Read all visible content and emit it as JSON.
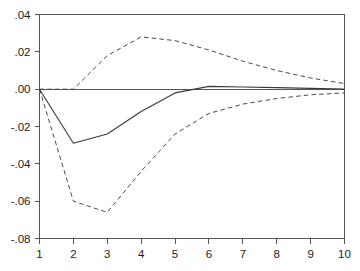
{
  "chart_data": {
    "type": "line",
    "title": "",
    "subtitle": "",
    "xlabel": "",
    "ylabel": "",
    "x": [
      1,
      2,
      3,
      4,
      5,
      6,
      7,
      8,
      9,
      10
    ],
    "xlim": [
      1,
      10
    ],
    "ylim": [
      -0.08,
      0.04
    ],
    "grid": false,
    "legend": "none",
    "x_ticks": [
      "1",
      "2",
      "3",
      "4",
      "5",
      "6",
      "7",
      "8",
      "9",
      "10"
    ],
    "y_ticks": [
      ".04",
      ".02",
      ".00",
      "-.02",
      "-.04",
      "-.06",
      "-.08"
    ],
    "y_tick_values": [
      0.04,
      0.02,
      0.0,
      -0.02,
      -0.04,
      -0.06,
      -0.08
    ],
    "zero_line": 0.0,
    "series": [
      {
        "name": "impulse-response",
        "style": "solid",
        "color": "#3a3a3a",
        "values": [
          0.0,
          -0.029,
          -0.024,
          -0.012,
          -0.002,
          0.0015,
          0.0012,
          0.0008,
          0.0004,
          0.0001
        ]
      },
      {
        "name": "upper-confidence-band",
        "style": "dashed",
        "color": "#4a4a4a",
        "values": [
          0.0,
          0.0,
          0.018,
          0.028,
          0.026,
          0.021,
          0.015,
          0.01,
          0.006,
          0.003
        ]
      },
      {
        "name": "lower-confidence-band",
        "style": "dashed",
        "color": "#4a4a4a",
        "values": [
          0.0,
          -0.06,
          -0.066,
          -0.044,
          -0.024,
          -0.013,
          -0.008,
          -0.005,
          -0.003,
          -0.002
        ]
      }
    ]
  },
  "axes": {
    "y_tick_labels": [
      ".04",
      ".02",
      ".00",
      "-.02",
      "-.04",
      "-.06",
      "-.08"
    ],
    "x_tick_labels": [
      "1",
      "2",
      "3",
      "4",
      "5",
      "6",
      "7",
      "8",
      "9",
      "10"
    ]
  }
}
